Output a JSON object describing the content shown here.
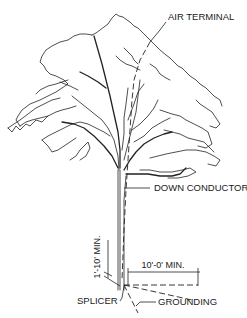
{
  "diagram": {
    "labels": {
      "air_terminal": "AIR TERMINAL",
      "down_conductor": "DOWN CONDUCTOR",
      "splicer": "SPLICER",
      "grounding": "GROUNDING"
    },
    "dimensions": {
      "vertical": "1'-10' MIN.",
      "horizontal": "10'-0' MIN."
    },
    "colors": {
      "ink": "#222222",
      "background": "#ffffff"
    }
  }
}
